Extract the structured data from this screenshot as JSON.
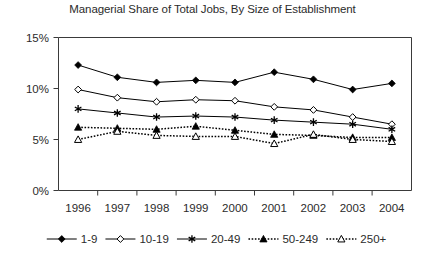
{
  "chart_data": {
    "type": "line",
    "title": "Managerial Share of Total Jobs, By Size of Establishment",
    "xlabel": "",
    "ylabel": "",
    "x": [
      "1996",
      "1997",
      "1998",
      "1999",
      "2000",
      "2001",
      "2002",
      "2003",
      "2004"
    ],
    "categories": [
      "1996",
      "1997",
      "1998",
      "1999",
      "2000",
      "2001",
      "2002",
      "2003",
      "2004"
    ],
    "ylim": [
      0,
      15
    ],
    "yticks": [
      0,
      5,
      10,
      15
    ],
    "ytick_labels": [
      "0%",
      "5%",
      "10%",
      "15%"
    ],
    "grid": false,
    "legend_position": "bottom",
    "series": [
      {
        "name": "1-9",
        "marker": "filled-diamond",
        "linestyle": "solid",
        "values": [
          12.3,
          11.1,
          10.6,
          10.8,
          10.6,
          11.6,
          10.9,
          9.9,
          10.5
        ]
      },
      {
        "name": "10-19",
        "marker": "open-diamond",
        "linestyle": "solid",
        "values": [
          9.9,
          9.1,
          8.7,
          8.9,
          8.8,
          8.2,
          7.9,
          7.2,
          6.5
        ]
      },
      {
        "name": "20-49",
        "marker": "star",
        "linestyle": "solid",
        "values": [
          8.0,
          7.6,
          7.2,
          7.3,
          7.2,
          6.9,
          6.7,
          6.5,
          6.0
        ]
      },
      {
        "name": "50-249",
        "marker": "filled-triangle",
        "linestyle": "dotted",
        "values": [
          6.2,
          6.1,
          6.0,
          6.3,
          5.9,
          5.5,
          5.4,
          5.2,
          5.2
        ]
      },
      {
        "name": "250+",
        "marker": "open-triangle",
        "linestyle": "dotted",
        "values": [
          5.0,
          5.8,
          5.4,
          5.3,
          5.3,
          4.6,
          5.5,
          5.0,
          4.8
        ]
      }
    ]
  },
  "legend": {
    "entries": [
      {
        "label": "1-9"
      },
      {
        "label": "10-19"
      },
      {
        "label": "20-49"
      },
      {
        "label": "50-249"
      },
      {
        "label": "250+"
      }
    ]
  }
}
